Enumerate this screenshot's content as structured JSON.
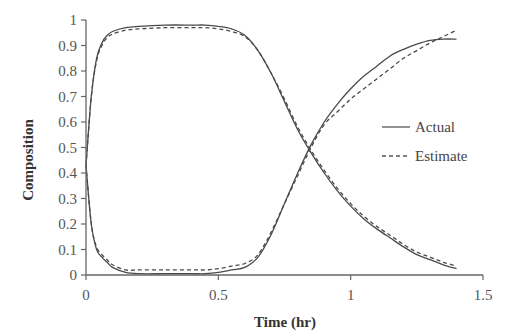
{
  "chart_data": {
    "type": "line",
    "title": "",
    "xlabel": "Time (hr)",
    "ylabel": "Composition",
    "xlim": [
      0,
      1.5
    ],
    "ylim": [
      0,
      1
    ],
    "xticks": [
      0,
      0.5,
      1,
      1.5
    ],
    "xtick_labels": [
      "0",
      "0.5",
      "1",
      "1.5"
    ],
    "yticks": [
      0,
      0.1,
      0.2,
      0.3,
      0.4,
      0.5,
      0.6,
      0.7,
      0.8,
      0.9,
      1
    ],
    "ytick_labels": [
      "0",
      "0.1",
      "0.2",
      "0.3",
      "0.4",
      "0.5",
      "0.6",
      "0.7",
      "0.8",
      "0.9",
      "1"
    ],
    "grid": false,
    "legend": {
      "position": "right-center",
      "entries": [
        {
          "label": "Actual",
          "style": "solid"
        },
        {
          "label": "Estimate",
          "style": "dashed"
        }
      ]
    },
    "series": [
      {
        "name": "Actual (component 1)",
        "style": "solid",
        "x": [
          0,
          0.02,
          0.04,
          0.06,
          0.08,
          0.1,
          0.15,
          0.2,
          0.3,
          0.4,
          0.45,
          0.5,
          0.55,
          0.6,
          0.65,
          0.7,
          0.75,
          0.8,
          0.85,
          0.9,
          0.95,
          1.0,
          1.05,
          1.1,
          1.15,
          1.2,
          1.25,
          1.3,
          1.35,
          1.4
        ],
        "y": [
          0.43,
          0.7,
          0.85,
          0.91,
          0.94,
          0.955,
          0.97,
          0.975,
          0.98,
          0.98,
          0.98,
          0.975,
          0.965,
          0.94,
          0.88,
          0.79,
          0.68,
          0.57,
          0.48,
          0.4,
          0.33,
          0.27,
          0.22,
          0.18,
          0.145,
          0.11,
          0.08,
          0.06,
          0.04,
          0.025
        ]
      },
      {
        "name": "Estimate (component 1)",
        "style": "dashed",
        "x": [
          0,
          0.02,
          0.04,
          0.06,
          0.08,
          0.1,
          0.15,
          0.2,
          0.3,
          0.4,
          0.45,
          0.5,
          0.55,
          0.6,
          0.65,
          0.7,
          0.75,
          0.8,
          0.85,
          0.9,
          0.95,
          1.0,
          1.05,
          1.1,
          1.15,
          1.2,
          1.25,
          1.3,
          1.35,
          1.4
        ],
        "y": [
          0.43,
          0.7,
          0.84,
          0.9,
          0.93,
          0.945,
          0.96,
          0.965,
          0.97,
          0.97,
          0.97,
          0.965,
          0.955,
          0.935,
          0.88,
          0.79,
          0.69,
          0.58,
          0.49,
          0.41,
          0.34,
          0.28,
          0.23,
          0.19,
          0.155,
          0.12,
          0.09,
          0.07,
          0.05,
          0.035
        ]
      },
      {
        "name": "Actual (component 2)",
        "style": "solid",
        "x": [
          0,
          0.02,
          0.04,
          0.06,
          0.08,
          0.1,
          0.15,
          0.2,
          0.3,
          0.4,
          0.45,
          0.5,
          0.55,
          0.6,
          0.65,
          0.7,
          0.75,
          0.8,
          0.85,
          0.9,
          0.95,
          1.0,
          1.05,
          1.1,
          1.15,
          1.2,
          1.25,
          1.3,
          1.35,
          1.4
        ],
        "y": [
          0.43,
          0.2,
          0.1,
          0.07,
          0.05,
          0.03,
          0.01,
          0.005,
          0.005,
          0.005,
          0.005,
          0.01,
          0.02,
          0.03,
          0.07,
          0.16,
          0.28,
          0.4,
          0.51,
          0.6,
          0.67,
          0.73,
          0.78,
          0.82,
          0.86,
          0.885,
          0.905,
          0.92,
          0.925,
          0.925
        ]
      },
      {
        "name": "Estimate (component 2)",
        "style": "dashed",
        "x": [
          0,
          0.02,
          0.04,
          0.06,
          0.08,
          0.1,
          0.15,
          0.2,
          0.3,
          0.4,
          0.45,
          0.5,
          0.55,
          0.6,
          0.65,
          0.7,
          0.75,
          0.8,
          0.85,
          0.9,
          0.95,
          1.0,
          1.05,
          1.1,
          1.15,
          1.2,
          1.25,
          1.3,
          1.35,
          1.4
        ],
        "y": [
          0.43,
          0.2,
          0.11,
          0.08,
          0.06,
          0.04,
          0.02,
          0.02,
          0.02,
          0.02,
          0.02,
          0.025,
          0.035,
          0.045,
          0.08,
          0.17,
          0.28,
          0.39,
          0.5,
          0.59,
          0.64,
          0.69,
          0.73,
          0.77,
          0.81,
          0.85,
          0.88,
          0.91,
          0.935,
          0.96
        ]
      }
    ]
  }
}
